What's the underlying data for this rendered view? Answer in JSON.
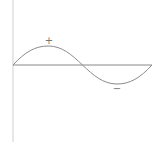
{
  "diagram": {
    "type": "sine-wave",
    "colors": {
      "axis": "#cfcfcf",
      "horizontal_axis": "#888888",
      "curve": "#8a8a8a",
      "label": "#777777"
    },
    "labels": {
      "positive": "+",
      "negative": "−"
    },
    "geometry": {
      "origin": [
        13,
        65
      ],
      "amplitude_px": 19,
      "period_px": 139,
      "y_axis": {
        "x": 13,
        "y_top": 0,
        "y_bottom": 142
      },
      "x_axis": {
        "y": 65,
        "x_start": 13,
        "x_end": 152
      }
    }
  }
}
